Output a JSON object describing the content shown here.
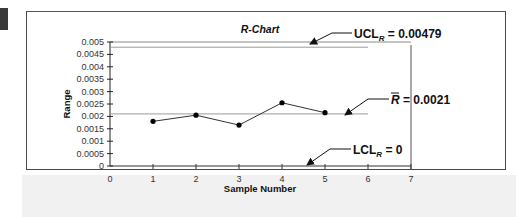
{
  "chart_data": {
    "type": "line",
    "title": "R-Chart",
    "xlabel": "Sample Number",
    "ylabel": "Range",
    "x": [
      1,
      2,
      3,
      4,
      5
    ],
    "series": [
      {
        "name": "Range",
        "values": [
          0.0018,
          0.00205,
          0.00165,
          0.00255,
          0.00215
        ]
      }
    ],
    "xlim": [
      0,
      7
    ],
    "ylim": [
      0,
      0.005
    ],
    "x_ticks": [
      "0",
      "1",
      "2",
      "3",
      "4",
      "5",
      "6",
      "7"
    ],
    "y_ticks": [
      "0.005",
      "0.0045",
      "0.004",
      "0.0035",
      "0.003",
      "0.0025",
      "0.002",
      "0.0015",
      "0.001",
      "0.0005",
      "0"
    ],
    "grid": false,
    "legend": "none",
    "reference_lines": [
      {
        "name": "UCL_R",
        "value": 0.00479,
        "label_main": "UCL",
        "label_sub": "R",
        "label_value": " = 0.00479"
      },
      {
        "name": "R-bar",
        "value": 0.0021,
        "label_main": "R",
        "label_value": " = 0.0021"
      },
      {
        "name": "LCL_R",
        "value": 0,
        "label_main": "LCL",
        "label_sub": "R",
        "label_value": " = 0"
      }
    ]
  },
  "labels": {
    "title": "R-Chart",
    "xlabel": "Sample Number",
    "ylabel": "Range",
    "ucl_main": "UCL",
    "ucl_sub": "R",
    "ucl_value": " = 0.00479",
    "rbar_main": "R",
    "rbar_value": " = 0.0021",
    "lcl_main": "LCL",
    "lcl_sub": "R",
    "lcl_value": " = 0"
  }
}
